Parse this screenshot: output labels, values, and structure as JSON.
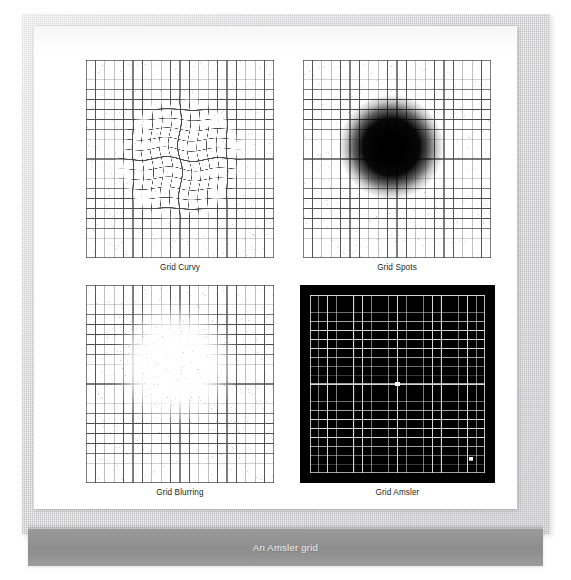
{
  "figure": {
    "caption": "An Amsler grid",
    "background_color": "#ffffff",
    "frame_color": "#f3f3f2",
    "caption_bar_color": "#8d8d8d",
    "caption_text_color": "#f0f0f0"
  },
  "panels": [
    {
      "id": "grid-curvy",
      "label": "Grid Curvy",
      "type": "metamorphopsia",
      "description": "Square grid with wavy distortion in the central region",
      "grid": {
        "columns": 20,
        "rows": 20,
        "line_color": "#4d4d4d",
        "background": "#ffffff"
      },
      "distortion": {
        "kind": "wave",
        "center_x": 0.5,
        "center_y": 0.5,
        "radius": 0.34,
        "amplitude": 2.6,
        "frequency": 3.4
      },
      "x": 86,
      "y": 60,
      "width": 188,
      "height": 198
    },
    {
      "id": "grid-spots",
      "label": "Grid Spots",
      "type": "central-scotoma-dark",
      "description": "Square grid with a dark blurred blob obscuring the centre",
      "grid": {
        "columns": 20,
        "rows": 20,
        "line_color": "#4d4d4d",
        "background": "#ffffff"
      },
      "blob": {
        "color": "#000000",
        "center_x": 0.47,
        "center_y": 0.44,
        "radius": 0.16
      },
      "x": 303,
      "y": 60,
      "width": 188,
      "height": 198
    },
    {
      "id": "grid-blurring",
      "label": "Grid Blurring",
      "type": "central-scotoma-light",
      "description": "Square grid with a bright blurred blob obscuring the centre",
      "grid": {
        "columns": 20,
        "rows": 20,
        "line_color": "#4d4d4d",
        "background": "#ffffff"
      },
      "blob": {
        "color": "#ffffff",
        "center_x": 0.47,
        "center_y": 0.4,
        "radius": 0.2
      },
      "x": 86,
      "y": 285,
      "width": 188,
      "height": 198
    },
    {
      "id": "grid-amsler",
      "label": "Grid Amsler",
      "type": "amsler-standard",
      "description": "Standard Amsler chart: white grid on black field with central fixation dot",
      "grid": {
        "columns": 20,
        "rows": 20,
        "line_color": "#d9d9d9",
        "background": "#000000"
      },
      "border": {
        "color": "#000000",
        "width": 10
      },
      "dots": [
        {
          "name": "fixation-dot",
          "x": 0.5,
          "y": 0.5,
          "radius": 2.2,
          "color": "#ffffff"
        },
        {
          "name": "secondary-dot",
          "x": 0.92,
          "y": 0.92,
          "radius": 1.8,
          "color": "#ffffff"
        }
      ],
      "x": 300,
      "y": 285,
      "width": 195,
      "height": 198
    }
  ]
}
